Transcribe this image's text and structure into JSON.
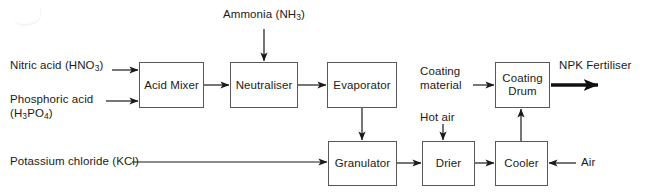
{
  "diagram": {
    "type": "process-flow-block-diagram",
    "stroke_color": "#1a1a1a",
    "box_border_color": "#58585a",
    "background_color": "#ffffff",
    "nodes": [
      {
        "id": "acid-mixer",
        "label": "Acid Mixer",
        "x": 139,
        "y": 62,
        "w": 65,
        "h": 46
      },
      {
        "id": "neutraliser",
        "label": "Neutraliser",
        "x": 230,
        "y": 62,
        "w": 68,
        "h": 46
      },
      {
        "id": "evaporator",
        "label": "Evaporator",
        "x": 327,
        "y": 62,
        "w": 70,
        "h": 46
      },
      {
        "id": "coating-drum",
        "label": "Coating\nDrum",
        "x": 495,
        "y": 62,
        "w": 55,
        "h": 46
      },
      {
        "id": "granulator",
        "label": "Granulator",
        "x": 328,
        "y": 141,
        "w": 69,
        "h": 45
      },
      {
        "id": "drier",
        "label": "Drier",
        "x": 422,
        "y": 141,
        "w": 53,
        "h": 45
      },
      {
        "id": "cooler",
        "label": "Cooler",
        "x": 495,
        "y": 141,
        "w": 53,
        "h": 45
      }
    ],
    "flow_labels": [
      {
        "id": "nitric-acid",
        "text": "Nitric acid (HNO3)",
        "html": "Nitric acid (HNO<span class=\"sub\">3</span>)",
        "x": 10,
        "y": 59,
        "w": 110,
        "align": "left"
      },
      {
        "id": "phosphoric-acid",
        "text": "Phosphoric acid (H3PO4)",
        "html": "Phosphoric acid<br>(H<span class=\"sub\">3</span>PO<span class=\"sub\">4</span>)",
        "x": 10,
        "y": 93,
        "w": 110,
        "align": "left"
      },
      {
        "id": "potassium-chloride",
        "text": "Potassium chloride (KCl)",
        "html": "Potassium chloride (KCl)",
        "x": 10,
        "y": 155,
        "w": 125,
        "align": "left"
      },
      {
        "id": "ammonia",
        "text": "Ammonia (NH3)",
        "html": "Ammonia (NH<span class=\"sub\">3</span>)",
        "x": 212,
        "y": 8,
        "w": 104,
        "align": "center"
      },
      {
        "id": "coating-material",
        "text": "Coating material",
        "html": "Coating<br>material",
        "x": 420,
        "y": 65,
        "w": 52,
        "align": "left"
      },
      {
        "id": "hot-air",
        "text": "Hot air",
        "html": "Hot air",
        "x": 420,
        "y": 112,
        "w": 46,
        "align": "left"
      },
      {
        "id": "air",
        "text": "Air",
        "html": "Air",
        "x": 580,
        "y": 157,
        "w": 28,
        "align": "left"
      },
      {
        "id": "npk-fertiliser",
        "text": "NPK Fertiliser",
        "html": "NPK Fertiliser",
        "x": 559,
        "y": 59,
        "w": 90,
        "align": "left"
      }
    ],
    "connectors": [
      {
        "id": "nitric-to-mixer",
        "from": "nitric-acid",
        "to": "acid-mixer",
        "kind": "thin-arrow",
        "direction": "right"
      },
      {
        "id": "phosphoric-to-mixer",
        "from": "phosphoric-acid",
        "to": "acid-mixer",
        "kind": "thin-arrow",
        "direction": "right"
      },
      {
        "id": "mixer-to-neutraliser",
        "from": "acid-mixer",
        "to": "neutraliser",
        "kind": "thin-arrow",
        "direction": "right"
      },
      {
        "id": "ammonia-to-neutraliser",
        "from": "ammonia",
        "to": "neutraliser",
        "kind": "thin-arrow",
        "direction": "down"
      },
      {
        "id": "neutraliser-to-evaporator",
        "from": "neutraliser",
        "to": "evaporator",
        "kind": "thin-arrow",
        "direction": "right"
      },
      {
        "id": "evaporator-to-granulator",
        "from": "evaporator",
        "to": "granulator",
        "kind": "thin-arrow",
        "direction": "down"
      },
      {
        "id": "kcl-to-granulator",
        "from": "potassium-chloride",
        "to": "granulator",
        "kind": "thin-arrow",
        "direction": "right"
      },
      {
        "id": "granulator-to-drier",
        "from": "granulator",
        "to": "drier",
        "kind": "thin-arrow",
        "direction": "right"
      },
      {
        "id": "hotair-to-drier",
        "from": "hot-air",
        "to": "drier",
        "kind": "thin-arrow",
        "direction": "down"
      },
      {
        "id": "drier-to-cooler",
        "from": "drier",
        "to": "cooler",
        "kind": "thin-arrow",
        "direction": "right"
      },
      {
        "id": "air-to-cooler",
        "from": "air",
        "to": "cooler",
        "kind": "thin-arrow",
        "direction": "left"
      },
      {
        "id": "cooler-to-coating-drum",
        "from": "cooler",
        "to": "coating-drum",
        "kind": "thin-arrow",
        "direction": "up"
      },
      {
        "id": "coating-material-to-drum",
        "from": "coating-material",
        "to": "coating-drum",
        "kind": "thin-arrow",
        "direction": "right"
      },
      {
        "id": "drum-to-npk",
        "from": "coating-drum",
        "to": "npk-fertiliser",
        "kind": "thick-arrow",
        "direction": "right"
      }
    ]
  }
}
